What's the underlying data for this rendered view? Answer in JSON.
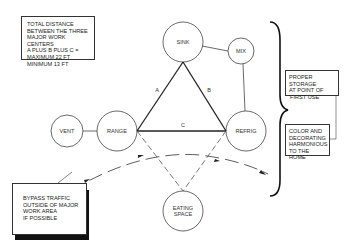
{
  "notes": {
    "total_distance": [
      "TOTAL DISTANCE",
      "BETWEEN THE THREE",
      "MAJOR WORK CENTERS",
      "A PLUS B PLUS C =",
      "MAXIMUM   22 FT",
      "MINIMUM   13 FT"
    ],
    "proper_storage": [
      "PROPER STORAGE",
      "AT POINT OF",
      "'FIRST USE'"
    ],
    "color_decorating": [
      "COLOR AND",
      "DECORATING",
      "HARMONIOUS",
      "TO THE HOME"
    ],
    "bypass_traffic": [
      "BYPASS TRAFFIC",
      "OUTSIDE OF MAJOR",
      "WORK AREA",
      "IF POSSIBLE"
    ]
  },
  "nodes": {
    "sink": "SINK",
    "mix": "MIX",
    "vent": "VENT",
    "range": "RANGE",
    "refrig": "REFRIG",
    "eating_space_1": "EATING",
    "eating_space_2": "SPACE"
  },
  "edges": {
    "a": "A",
    "b": "B",
    "c": "C"
  },
  "colors": {
    "line": "#333333",
    "background": "#ffffff"
  }
}
